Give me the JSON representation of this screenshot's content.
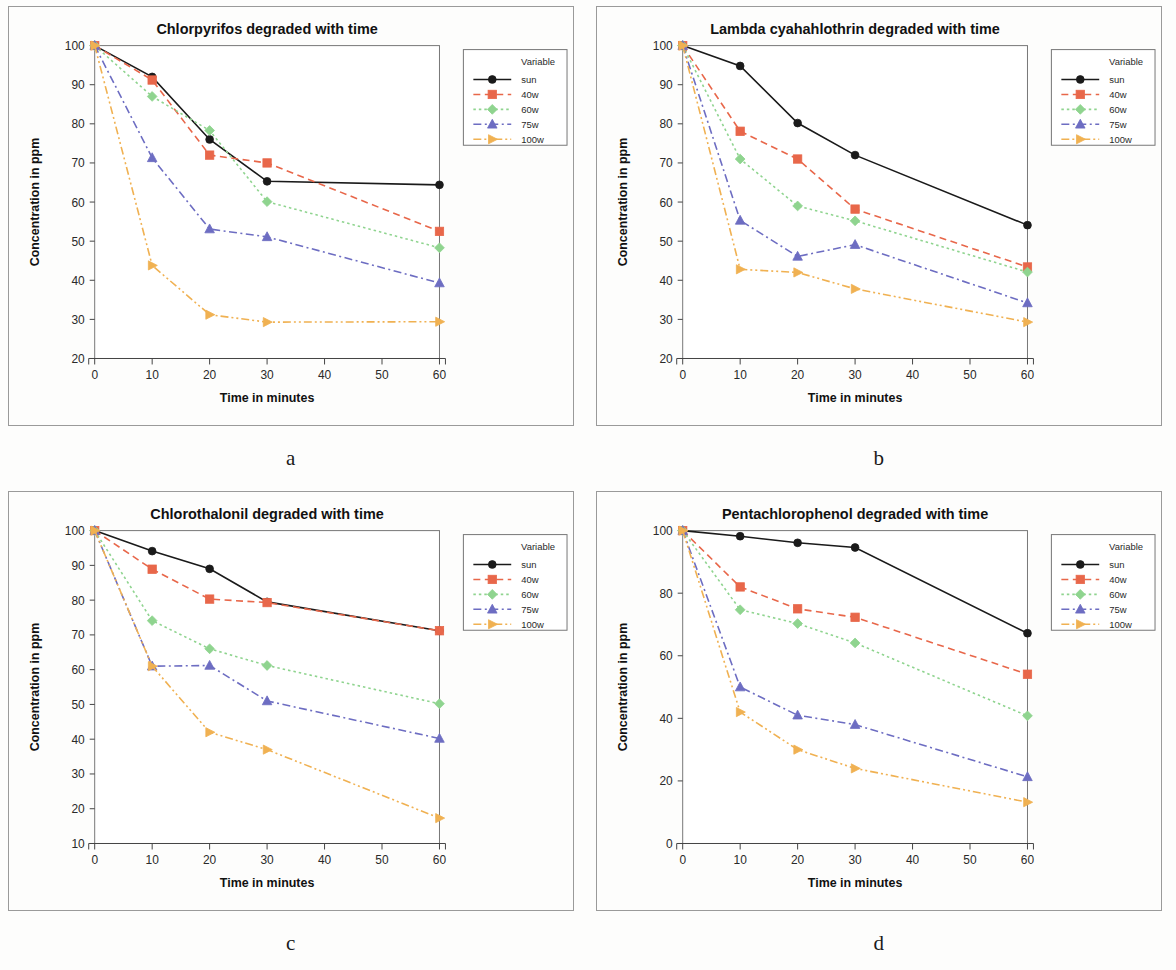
{
  "figure": {
    "background_color": "#fdfdfc",
    "panel_border_color": "#9a9a9a"
  },
  "common": {
    "xlabel": "Time in minutes",
    "ylabel": "Concentration in ppm",
    "legend_title": "Variable",
    "x_ticks": [
      0,
      10,
      20,
      30,
      40,
      50,
      60
    ],
    "x_values": [
      0,
      10,
      20,
      30,
      60
    ],
    "series_names": [
      "sun",
      "40w",
      "60w",
      "75w",
      "100w"
    ],
    "series_colors": [
      "#1a1a1a",
      "#e8674a",
      "#8fd48f",
      "#6d6dc2",
      "#f0b152"
    ],
    "series_markers": [
      "circle",
      "square",
      "diamond",
      "triangle-up",
      "triangle-right"
    ],
    "series_dash": [
      "solid",
      "dashed",
      "dotted",
      "dashdot",
      "dashdotdot"
    ]
  },
  "panels": [
    {
      "caption": "a",
      "chart_data": {
        "type": "line",
        "title": "Chlorpyrifos degraded with time",
        "xlabel": "Time in minutes",
        "ylabel": "Concentration in ppm",
        "x": [
          0,
          10,
          20,
          30,
          60
        ],
        "xlim": [
          0,
          60
        ],
        "ylim": [
          20,
          100
        ],
        "y_ticks": [
          20,
          30,
          40,
          50,
          60,
          70,
          80,
          90,
          100
        ],
        "x_ticks": [
          0,
          10,
          20,
          30,
          40,
          50,
          60
        ],
        "grid": false,
        "legend_position": "right-outside",
        "legend_title": "Variable",
        "series": [
          {
            "name": "sun",
            "values": [
              100,
              92.0,
              76.0,
              65.3,
              64.4
            ]
          },
          {
            "name": "40w",
            "values": [
              100,
              91.2,
              72.0,
              70.0,
              52.5
            ]
          },
          {
            "name": "60w",
            "values": [
              100,
              87.0,
              78.3,
              60.1,
              48.3
            ]
          },
          {
            "name": "75w",
            "values": [
              100,
              71.3,
              53.1,
              51.1,
              39.3
            ]
          },
          {
            "name": "100w",
            "values": [
              100,
              43.8,
              31.2,
              29.3,
              29.4
            ]
          }
        ]
      }
    },
    {
      "caption": "b",
      "chart_data": {
        "type": "line",
        "title": "Lambda cyahahlothrin degraded with time",
        "xlabel": "Time in minutes",
        "ylabel": "Concentration in ppm",
        "x": [
          0,
          10,
          20,
          30,
          60
        ],
        "xlim": [
          0,
          60
        ],
        "ylim": [
          20,
          100
        ],
        "y_ticks": [
          20,
          30,
          40,
          50,
          60,
          70,
          80,
          90,
          100
        ],
        "x_ticks": [
          0,
          10,
          20,
          30,
          40,
          50,
          60
        ],
        "grid": false,
        "legend_position": "right-outside",
        "legend_title": "Variable",
        "series": [
          {
            "name": "sun",
            "values": [
              100,
              94.8,
              80.2,
              72.0,
              54.1
            ]
          },
          {
            "name": "40w",
            "values": [
              100,
              78.1,
              71.0,
              58.2,
              43.4
            ]
          },
          {
            "name": "60w",
            "values": [
              100,
              71.0,
              59.0,
              55.2,
              42.1
            ]
          },
          {
            "name": "75w",
            "values": [
              100,
              55.3,
              46.1,
              49.1,
              34.2
            ]
          },
          {
            "name": "100w",
            "values": [
              100,
              42.8,
              42.0,
              37.8,
              29.3
            ]
          }
        ]
      }
    },
    {
      "caption": "c",
      "chart_data": {
        "type": "line",
        "title": "Chlorothalonil degraded with time",
        "xlabel": "Time in minutes",
        "ylabel": "Concentration in ppm",
        "x": [
          0,
          10,
          20,
          30,
          60
        ],
        "xlim": [
          0,
          60
        ],
        "ylim": [
          10,
          100
        ],
        "y_ticks": [
          10,
          20,
          30,
          40,
          50,
          60,
          70,
          80,
          90,
          100
        ],
        "x_ticks": [
          0,
          10,
          20,
          30,
          40,
          50,
          60
        ],
        "grid": false,
        "legend_position": "right-outside",
        "legend_title": "Variable",
        "series": [
          {
            "name": "sun",
            "values": [
              100,
              94.1,
              89.0,
              79.5,
              71.2
            ]
          },
          {
            "name": "40w",
            "values": [
              100,
              88.9,
              80.3,
              79.3,
              71.2
            ]
          },
          {
            "name": "60w",
            "values": [
              100,
              74.1,
              66.0,
              61.2,
              50.2
            ]
          },
          {
            "name": "75w",
            "values": [
              100,
              61.0,
              61.2,
              51.0,
              40.2
            ]
          },
          {
            "name": "100w",
            "values": [
              100,
              61.0,
              42.0,
              37.0,
              17.3
            ]
          }
        ]
      }
    },
    {
      "caption": "d",
      "chart_data": {
        "type": "line",
        "title": "Pentachlorophenol degraded with time",
        "xlabel": "Time in minutes",
        "ylabel": "Concentration in ppm",
        "x": [
          0,
          10,
          20,
          30,
          60
        ],
        "xlim": [
          0,
          60
        ],
        "ylim": [
          0,
          100
        ],
        "y_ticks": [
          0,
          20,
          40,
          60,
          80,
          100
        ],
        "x_ticks": [
          0,
          10,
          20,
          30,
          40,
          50,
          60
        ],
        "grid": false,
        "legend_position": "right-outside",
        "legend_title": "Variable",
        "series": [
          {
            "name": "sun",
            "values": [
              100,
              98.2,
              96.1,
              94.6,
              67.2
            ]
          },
          {
            "name": "40w",
            "values": [
              100,
              82.0,
              75.0,
              72.3,
              54.1
            ]
          },
          {
            "name": "60w",
            "values": [
              100,
              74.7,
              70.3,
              64.1,
              40.8
            ]
          },
          {
            "name": "75w",
            "values": [
              100,
              50.0,
              41.0,
              38.0,
              21.3
            ]
          },
          {
            "name": "100w",
            "values": [
              100,
              42.0,
              30.0,
              24.0,
              13.2
            ]
          }
        ]
      }
    }
  ]
}
